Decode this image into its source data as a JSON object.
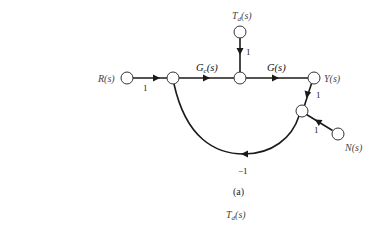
{
  "diagram": {
    "type": "signal-flow-graph",
    "caption": "(a)",
    "nodes": {
      "input": {
        "label": "R(s)"
      },
      "disturbance": {
        "label_main": "T",
        "label_sub": "d",
        "label_rest": "(s)"
      },
      "output": {
        "label": "Y(s)"
      },
      "noise": {
        "label": "N(s)"
      }
    },
    "branches": {
      "input_gain": "1",
      "controller": {
        "main": "G",
        "sub": "c",
        "rest": "(s)"
      },
      "plant": "G(s)",
      "disturbance_gain": "1",
      "output_gain": "1",
      "noise_gain": "1",
      "feedback_gain": "−1"
    },
    "bottom_label": {
      "main": "T",
      "sub": "d",
      "rest": "(s)"
    },
    "colors": {
      "line": "#1a1a1a",
      "node_fill": "#ffffff",
      "text": "#444444"
    }
  }
}
